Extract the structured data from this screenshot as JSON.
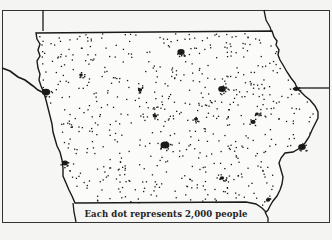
{
  "map": {
    "subject": "Iowa population distribution (dot-density map)",
    "caption": "Each dot represents 2,000 people",
    "dot_value_people": 2000,
    "colors": {
      "background": "#f4f4f2",
      "ink": "#1a1a1a",
      "state_fill": "#fbfbf9"
    },
    "features": {
      "state": "Iowa",
      "rivers": [
        "Missouri River (west border)",
        "Mississippi River (east border)"
      ],
      "neighbor_boundaries": [
        "Minnesota",
        "Wisconsin",
        "Illinois",
        "Missouri",
        "Nebraska",
        "South Dakota"
      ]
    },
    "city_clusters": [
      {
        "name": "Sioux City",
        "size": "large"
      },
      {
        "name": "Des Moines",
        "size": "large"
      },
      {
        "name": "Cedar Rapids",
        "size": "large"
      },
      {
        "name": "Waterloo",
        "size": "large"
      },
      {
        "name": "Davenport",
        "size": "large"
      },
      {
        "name": "Dubuque",
        "size": "medium"
      },
      {
        "name": "Council Bluffs",
        "size": "medium"
      },
      {
        "name": "Iowa City",
        "size": "medium"
      },
      {
        "name": "Ames",
        "size": "small"
      },
      {
        "name": "Fort Dodge",
        "size": "small"
      },
      {
        "name": "Mason City",
        "size": "small"
      },
      {
        "name": "Ottumwa",
        "size": "small"
      },
      {
        "name": "Burlington",
        "size": "small"
      },
      {
        "name": "Marshalltown",
        "size": "small"
      },
      {
        "name": "Clinton",
        "size": "small"
      }
    ]
  }
}
